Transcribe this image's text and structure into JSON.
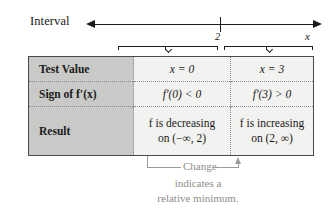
{
  "numberline": {
    "interval_label": "Interval",
    "axis_variable": "x",
    "critical_point_label": "2",
    "left_arrow": "left-arrowhead",
    "right_arrow": "right-arrowhead",
    "brace_left_name": "brace-interval-left",
    "brace_right_name": "brace-interval-right"
  },
  "table": {
    "rows": [
      {
        "header": "Test Value",
        "left": {
          "line1": "x = 0",
          "line2": ""
        },
        "right": {
          "line1": "x = 3",
          "line2": ""
        }
      },
      {
        "header": "Sign of f′(x)",
        "left": {
          "line1": "f′(0) < 0",
          "line2": ""
        },
        "right": {
          "line1": "f′(3) > 0",
          "line2": ""
        }
      },
      {
        "header": "Result",
        "left": {
          "line1": "f is decreasing",
          "line2": "on (−∞, 2)"
        },
        "right": {
          "line1": "f is increasing",
          "line2": "on (2, ∞)"
        }
      }
    ]
  },
  "caption": {
    "line1": "Change",
    "line2": "indicates a",
    "line3": "relative minimum."
  },
  "colors": {
    "header_fill": "#c9c9c7",
    "cell_fill": "#f2f2f0",
    "table_border": "#4a4a4a",
    "divider": "#8a8a88",
    "caption_text": "#8d8d8b",
    "ink": "#1d1d1d"
  }
}
